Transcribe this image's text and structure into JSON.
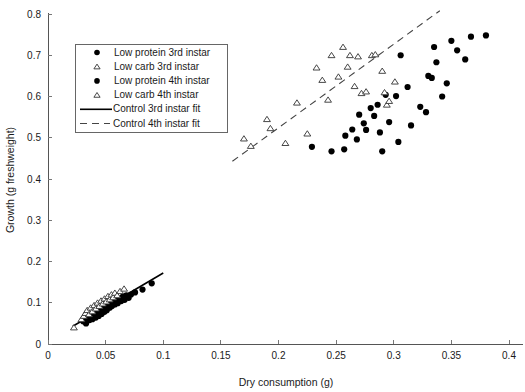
{
  "chart_data": {
    "type": "scatter",
    "title": "",
    "xlabel": "Dry consumption (g)",
    "ylabel": "Growth (g freshweight)",
    "xlim": [
      0,
      0.4
    ],
    "ylim": [
      0,
      0.8
    ],
    "xticks": [
      "0",
      "0.05",
      "0.1",
      "0.15",
      "0.2",
      "0.25",
      "0.3",
      "0.35",
      "0.4"
    ],
    "xtick_values": [
      0,
      0.05,
      0.1,
      0.15,
      0.2,
      0.25,
      0.3,
      0.35,
      0.4
    ],
    "yticks": [
      "0",
      "0.1",
      "0.2",
      "0.3",
      "0.4",
      "0.5",
      "0.6",
      "0.7",
      "0.8"
    ],
    "ytick_values": [
      0,
      0.1,
      0.2,
      0.3,
      0.4,
      0.5,
      0.6,
      0.7,
      0.8
    ],
    "grid": false,
    "legend_position": "upper-left",
    "series": [
      {
        "name": "Low protein 3rd instar",
        "marker": "filled-circle",
        "points": [
          [
            0.0305,
            0.055
          ],
          [
            0.033,
            0.05
          ],
          [
            0.0345,
            0.062
          ],
          [
            0.036,
            0.058
          ],
          [
            0.0375,
            0.066
          ],
          [
            0.0385,
            0.06
          ],
          [
            0.04,
            0.07
          ],
          [
            0.0415,
            0.064
          ],
          [
            0.0425,
            0.075
          ],
          [
            0.044,
            0.068
          ],
          [
            0.045,
            0.08
          ],
          [
            0.0465,
            0.073
          ],
          [
            0.0475,
            0.085
          ],
          [
            0.049,
            0.078
          ],
          [
            0.05,
            0.09
          ],
          [
            0.051,
            0.082
          ],
          [
            0.052,
            0.095
          ],
          [
            0.0535,
            0.088
          ],
          [
            0.0545,
            0.1
          ],
          [
            0.0555,
            0.092
          ],
          [
            0.057,
            0.103
          ],
          [
            0.058,
            0.096
          ],
          [
            0.0595,
            0.108
          ],
          [
            0.0605,
            0.099
          ],
          [
            0.062,
            0.11
          ],
          [
            0.0635,
            0.104
          ],
          [
            0.065,
            0.115
          ],
          [
            0.0665,
            0.107
          ],
          [
            0.068,
            0.118
          ],
          [
            0.07,
            0.112
          ],
          [
            0.072,
            0.12
          ],
          [
            0.0755,
            0.125
          ],
          [
            0.082,
            0.132
          ],
          [
            0.09,
            0.147
          ]
        ]
      },
      {
        "name": "Low carb 3rd instar",
        "marker": "open-triangle",
        "points": [
          [
            0.0225,
            0.04
          ],
          [
            0.029,
            0.06
          ],
          [
            0.031,
            0.068
          ],
          [
            0.0325,
            0.075
          ],
          [
            0.034,
            0.082
          ],
          [
            0.0355,
            0.072
          ],
          [
            0.037,
            0.088
          ],
          [
            0.0385,
            0.079
          ],
          [
            0.04,
            0.094
          ],
          [
            0.0415,
            0.086
          ],
          [
            0.043,
            0.1
          ],
          [
            0.0445,
            0.092
          ],
          [
            0.046,
            0.105
          ],
          [
            0.0475,
            0.098
          ],
          [
            0.049,
            0.11
          ],
          [
            0.0505,
            0.103
          ],
          [
            0.052,
            0.116
          ],
          [
            0.0535,
            0.108
          ],
          [
            0.055,
            0.12
          ],
          [
            0.0565,
            0.113
          ],
          [
            0.058,
            0.124
          ],
          [
            0.06,
            0.118
          ],
          [
            0.0625,
            0.128
          ],
          [
            0.066,
            0.134
          ]
        ]
      },
      {
        "name": "Low protein 4th instar",
        "marker": "filled-circle",
        "points": [
          [
            0.229,
            0.478
          ],
          [
            0.246,
            0.467
          ],
          [
            0.257,
            0.472
          ],
          [
            0.258,
            0.505
          ],
          [
            0.264,
            0.52
          ],
          [
            0.268,
            0.496
          ],
          [
            0.27,
            0.556
          ],
          [
            0.274,
            0.535
          ],
          [
            0.276,
            0.519
          ],
          [
            0.28,
            0.572
          ],
          [
            0.283,
            0.553
          ],
          [
            0.286,
            0.58
          ],
          [
            0.288,
            0.513
          ],
          [
            0.29,
            0.467
          ],
          [
            0.293,
            0.604
          ],
          [
            0.296,
            0.538
          ],
          [
            0.302,
            0.601
          ],
          [
            0.304,
            0.49
          ],
          [
            0.306,
            0.7
          ],
          [
            0.312,
            0.623
          ],
          [
            0.315,
            0.53
          ],
          [
            0.323,
            0.575
          ],
          [
            0.328,
            0.562
          ],
          [
            0.33,
            0.65
          ],
          [
            0.333,
            0.645
          ],
          [
            0.335,
            0.72
          ],
          [
            0.337,
            0.683
          ],
          [
            0.342,
            0.6
          ],
          [
            0.346,
            0.632
          ],
          [
            0.35,
            0.735
          ],
          [
            0.355,
            0.712
          ],
          [
            0.362,
            0.69
          ],
          [
            0.367,
            0.745
          ],
          [
            0.38,
            0.748
          ]
        ]
      },
      {
        "name": "Low carb 4th instar",
        "marker": "open-triangle",
        "points": [
          [
            0.17,
            0.498
          ],
          [
            0.176,
            0.48
          ],
          [
            0.19,
            0.545
          ],
          [
            0.193,
            0.523
          ],
          [
            0.206,
            0.487
          ],
          [
            0.216,
            0.585
          ],
          [
            0.225,
            0.51
          ],
          [
            0.233,
            0.67
          ],
          [
            0.238,
            0.64
          ],
          [
            0.243,
            0.592
          ],
          [
            0.246,
            0.7
          ],
          [
            0.252,
            0.648
          ],
          [
            0.256,
            0.72
          ],
          [
            0.26,
            0.672
          ],
          [
            0.262,
            0.7
          ],
          [
            0.266,
            0.625
          ],
          [
            0.269,
            0.697
          ],
          [
            0.272,
            0.608
          ],
          [
            0.276,
            0.612
          ],
          [
            0.281,
            0.7
          ],
          [
            0.284,
            0.702
          ],
          [
            0.29,
            0.662
          ],
          [
            0.292,
            0.61
          ],
          [
            0.294,
            0.58
          ],
          [
            0.296,
            0.589
          ],
          [
            0.301,
            0.636
          ]
        ]
      }
    ],
    "fits": [
      {
        "name": "Control 3rd instar fit",
        "style": "solid",
        "x0": 0.0215,
        "y0": 0.043,
        "x1": 0.1,
        "y1": 0.172
      },
      {
        "name": "Control 4th instar fit",
        "style": "dashed",
        "x0": 0.16,
        "y0": 0.443,
        "x1": 0.34,
        "y1": 0.808
      }
    ]
  },
  "legend": {
    "items": [
      {
        "label": "Low protein 3rd instar",
        "marker": "filled-circle"
      },
      {
        "label": "Low carb 3rd instar",
        "marker": "open-triangle"
      },
      {
        "label": "Low protein 4th instar",
        "marker": "filled-circle"
      },
      {
        "label": "Low carb 4th instar",
        "marker": "open-triangle"
      },
      {
        "label": "Control 3rd instar fit",
        "marker": "solid-line"
      },
      {
        "label": "Control 4th instar fit",
        "marker": "dashed-line"
      }
    ]
  }
}
